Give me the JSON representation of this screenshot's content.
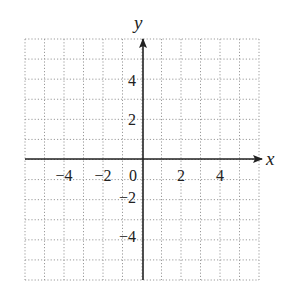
{
  "chart_data": {
    "type": "scatter",
    "title": "",
    "xlabel": "x",
    "ylabel": "y",
    "xlim": [
      -6,
      6
    ],
    "ylim": [
      -6,
      6
    ],
    "grid": true,
    "grid_style": "dotted",
    "grid_step": 1,
    "x_ticks": [
      -4,
      -2,
      0,
      2,
      4
    ],
    "x_tick_labels": [
      "−4",
      "−2",
      "0",
      "2",
      "4"
    ],
    "y_ticks": [
      4,
      2,
      -2,
      -4
    ],
    "y_tick_labels": [
      "4",
      "2",
      "−2",
      "−4"
    ],
    "series": [],
    "legend": null
  },
  "labels": {
    "x_axis": "x",
    "y_axis": "y",
    "x_ticks": [
      "−4",
      "−2",
      "0",
      "2",
      "4"
    ],
    "y_ticks": [
      "4",
      "2",
      "−2",
      "−4"
    ]
  },
  "colors": {
    "axis": "#222222",
    "grid": "#9a9a9a",
    "background": "#ffffff"
  }
}
